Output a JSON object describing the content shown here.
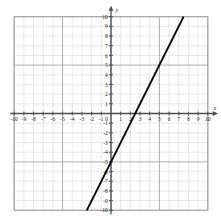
{
  "chart_data": {
    "type": "line",
    "title": "",
    "xlabel": "x",
    "ylabel": "y",
    "xlim": [
      -10,
      10
    ],
    "ylim": [
      -10,
      10
    ],
    "grid": true,
    "legend": false,
    "x_ticks": [
      -10,
      -9,
      -8,
      -7,
      -6,
      -5,
      -4,
      -3,
      -2,
      -1,
      0,
      1,
      2,
      3,
      4,
      5,
      6,
      7,
      8,
      9,
      10
    ],
    "y_ticks": [
      -10,
      -9,
      -8,
      -7,
      -6,
      -5,
      -4,
      -3,
      -2,
      -1,
      0,
      1,
      2,
      3,
      4,
      5,
      6,
      7,
      8,
      9,
      10
    ],
    "x_tick_labels": [
      "-10",
      "-9",
      "-8",
      "-7",
      "-6",
      "-5",
      "-4",
      "-3",
      "-2",
      "-1",
      "0",
      "1",
      "2",
      "3",
      "4",
      "5",
      "6",
      "7",
      "8",
      "9",
      "10"
    ],
    "y_tick_labels": [
      "-10",
      "-9",
      "-8",
      "-7",
      "-6",
      "-5",
      "-4",
      "-3",
      "-2",
      "-1",
      "0",
      "1",
      "2",
      "3",
      "4",
      "5",
      "6",
      "7",
      "8",
      "9",
      "10"
    ],
    "series": [
      {
        "name": "line",
        "equation": "y = 2x - 5",
        "slope": 2,
        "y_intercept": -5,
        "x_intercept": 2.5,
        "points": [
          [
            -2.5,
            -10
          ],
          [
            7.5,
            10
          ]
        ],
        "color": "#000000"
      }
    ],
    "colors": {
      "grid_minor": "#d9d9d9",
      "grid_major": "#a6a6a6",
      "axis": "#4d4d4d",
      "line": "#000000",
      "text": "#1a1a1a"
    }
  },
  "axis_labels": {
    "x": "x",
    "y": "y"
  }
}
